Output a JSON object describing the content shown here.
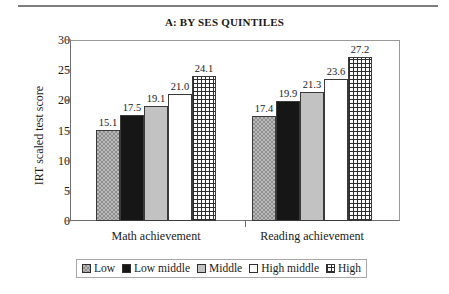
{
  "top_rule": "",
  "chart_data": {
    "type": "bar",
    "title": "A: BY SES QUINTILES",
    "xlabel": "",
    "ylabel": "IRT scaled test score",
    "ylim": [
      0,
      30
    ],
    "yticks": [
      0,
      5,
      10,
      15,
      20,
      25,
      30
    ],
    "grid": false,
    "legend_position": "bottom",
    "categories": [
      "Math achievement",
      "Reading achievement"
    ],
    "series": [
      {
        "name": "Low",
        "pattern": "checker-hatch",
        "values": [
          15.1,
          17.4
        ]
      },
      {
        "name": "Low middle",
        "pattern": "solid-black",
        "values": [
          17.5,
          19.9
        ]
      },
      {
        "name": "Middle",
        "pattern": "solid-gray",
        "values": [
          19.1,
          21.3
        ]
      },
      {
        "name": "High middle",
        "pattern": "white",
        "values": [
          21.0,
          23.6
        ]
      },
      {
        "name": "High",
        "pattern": "crosshatch",
        "values": [
          24.1,
          27.2
        ]
      }
    ],
    "data_labels": {
      "Math achievement": [
        "15.1",
        "17.5",
        "19.1",
        "21.0",
        "24.1"
      ],
      "Reading achievement": [
        "17.4",
        "19.9",
        "21.3",
        "23.6",
        "27.2"
      ]
    },
    "ytick_labels": [
      "0",
      "5",
      "10",
      "15",
      "20",
      "25",
      "30"
    ]
  },
  "colors": {
    "axis": "#6f6f6f",
    "frame_light": "#9a9a9a",
    "bar_outline": "#3a3a3a",
    "low_fill": "#b9b9b9",
    "low_middle_fill": "#161616",
    "middle_fill": "#c2c2c2",
    "high_middle_fill": "#ffffff",
    "high_fill": "#ffffff",
    "text": "#1a1a1a",
    "legend_border": "#a8a8a8",
    "rule": "#7d7d7d"
  }
}
